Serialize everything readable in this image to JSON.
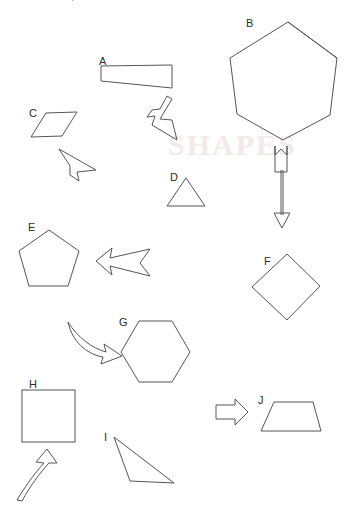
{
  "page": {
    "title_cut_off": "Name the shapes and cut one ball",
    "watermark": "SHAPES",
    "background_color": "#ffffff",
    "stroke_color": "#555555",
    "label_color": "#2b2b2b"
  },
  "shapes": [
    {
      "id": "A",
      "label": "A",
      "name": "quadrilateral-trapezoid",
      "label_x": 99,
      "label_y": 56
    },
    {
      "id": "B",
      "label": "B",
      "name": "heptagon",
      "label_x": 246,
      "label_y": 18
    },
    {
      "id": "C",
      "label": "C",
      "name": "parallelogram",
      "label_x": 29,
      "label_y": 108
    },
    {
      "id": "D",
      "label": "D",
      "name": "triangle",
      "label_x": 170,
      "label_y": 172
    },
    {
      "id": "E",
      "label": "E",
      "name": "pentagon",
      "label_x": 28,
      "label_y": 222
    },
    {
      "id": "F",
      "label": "F",
      "name": "diamond-square",
      "label_x": 264,
      "label_y": 256
    },
    {
      "id": "G",
      "label": "G",
      "name": "hexagon",
      "label_x": 119,
      "label_y": 317
    },
    {
      "id": "H",
      "label": "H",
      "name": "square",
      "label_x": 29,
      "label_y": 379
    },
    {
      "id": "I",
      "label": "I",
      "name": "obtuse-triangle",
      "label_x": 104,
      "label_y": 432
    },
    {
      "id": "J",
      "label": "J",
      "name": "trapezoid",
      "label_x": 258,
      "label_y": 395
    }
  ],
  "arrows": [
    {
      "name": "bent-arrow-up-right",
      "direction": "up-right"
    },
    {
      "name": "cursor-arrow-up-left",
      "direction": "up-left"
    },
    {
      "name": "arrow-down-fletched",
      "direction": "down"
    },
    {
      "name": "arrow-left-feathered",
      "direction": "left"
    },
    {
      "name": "curved-arrow-right",
      "direction": "right"
    },
    {
      "name": "curved-arrow-up",
      "direction": "up"
    },
    {
      "name": "block-arrow-right",
      "direction": "right"
    }
  ]
}
